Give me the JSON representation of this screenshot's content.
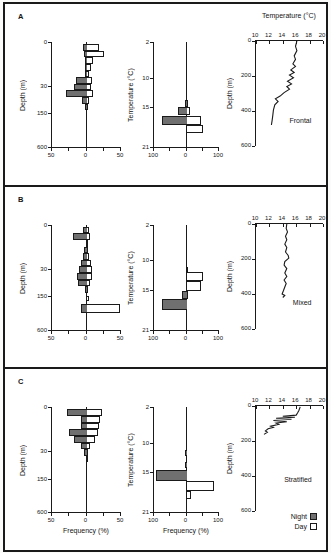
{
  "panels": [
    {
      "letter": "A"
    },
    {
      "letter": "B"
    },
    {
      "letter": "C"
    }
  ],
  "legend": {
    "night_label": "Night",
    "day_label": "Day"
  },
  "colors": {
    "night_fill": "#707070",
    "day_fill": "#ffffff",
    "line": "#1a1a1a",
    "frame": "#1a1a1a"
  },
  "chart_data": [
    {
      "type": "bar",
      "panel": "A",
      "orientation": "horizontal-diverging",
      "ylabel": "Depth (m)",
      "xmax": 50,
      "yticks": [
        [
          "0",
          0
        ],
        [
          "30",
          0.42
        ],
        [
          "150",
          0.68
        ],
        [
          "600",
          1
        ]
      ],
      "xticks": [
        [
          "50",
          0
        ],
        [
          "0",
          0.5
        ],
        [
          "50",
          1
        ]
      ],
      "series": [
        "Night",
        "Day"
      ],
      "bins": [
        {
          "pos": 0.02,
          "night": 5,
          "day": 18
        },
        {
          "pos": 0.083,
          "night": 3,
          "day": 25
        },
        {
          "pos": 0.146,
          "night": 2,
          "day": 10
        },
        {
          "pos": 0.209,
          "night": 2,
          "day": 7
        },
        {
          "pos": 0.272,
          "night": 2,
          "day": 4
        },
        {
          "pos": 0.335,
          "night": 15,
          "day": 8
        },
        {
          "pos": 0.398,
          "night": 18,
          "day": 6
        },
        {
          "pos": 0.461,
          "night": 30,
          "day": 10
        },
        {
          "pos": 0.524,
          "night": 6,
          "day": 4
        },
        {
          "pos": 0.587,
          "night": 2,
          "day": 1
        }
      ]
    },
    {
      "type": "bar",
      "panel": "A",
      "orientation": "horizontal-diverging",
      "ylabel": "Temperature (°C)",
      "xmax": 100,
      "yticks": [
        [
          "2",
          0
        ],
        [
          "10",
          0.34
        ],
        [
          "15",
          0.62
        ],
        [
          "21",
          1
        ]
      ],
      "xticks": [
        [
          "100",
          0
        ],
        [
          "0",
          0.5
        ],
        [
          "100",
          1
        ]
      ],
      "series": [
        "Night",
        "Day"
      ],
      "bins": [
        {
          "pos": 0.5,
          "night": 3,
          "day": 0,
          "h": 0.05
        },
        {
          "pos": 0.55,
          "night": 4,
          "day": 2,
          "h": 0.07
        },
        {
          "pos": 0.62,
          "night": 25,
          "day": 12,
          "h": 0.08
        },
        {
          "pos": 0.7,
          "night": 75,
          "day": 45,
          "h": 0.09
        },
        {
          "pos": 0.79,
          "night": 2,
          "day": 50,
          "h": 0.08
        }
      ]
    },
    {
      "type": "line",
      "panel": "A",
      "title": "Temperature (°C)",
      "label": "Frontal",
      "ylabel": "Depth (m)",
      "xrange": [
        10,
        20
      ],
      "yrange": [
        0,
        600
      ],
      "xticks": [
        [
          "10",
          0
        ],
        [
          "12",
          0.2
        ],
        [
          "14",
          0.4
        ],
        [
          "16",
          0.6
        ],
        [
          "18",
          0.8
        ],
        [
          "20",
          1
        ]
      ],
      "yticks": [
        [
          "0",
          0
        ],
        [
          "200",
          0.333
        ],
        [
          "400",
          0.667
        ],
        [
          "600",
          1
        ]
      ],
      "label_pos": [
        0.5,
        0.72
      ],
      "points": [
        [
          16.1,
          0
        ],
        [
          15.9,
          30
        ],
        [
          16.1,
          55
        ],
        [
          15.7,
          85
        ],
        [
          15.9,
          105
        ],
        [
          15.5,
          130
        ],
        [
          15.9,
          145
        ],
        [
          15.2,
          165
        ],
        [
          15.7,
          180
        ],
        [
          15.0,
          195
        ],
        [
          15.6,
          210
        ],
        [
          14.7,
          230
        ],
        [
          15.3,
          245
        ],
        [
          14.6,
          260
        ],
        [
          15.0,
          275
        ],
        [
          14.2,
          295
        ],
        [
          13.6,
          315
        ],
        [
          12.9,
          330
        ],
        [
          13.3,
          345
        ],
        [
          12.8,
          365
        ],
        [
          12.6,
          395
        ],
        [
          12.5,
          425
        ],
        [
          12.4,
          455
        ],
        [
          12.3,
          480
        ]
      ]
    },
    {
      "type": "bar",
      "panel": "B",
      "orientation": "horizontal-diverging",
      "ylabel": "Depth (m)",
      "xmax": 50,
      "yticks": [
        [
          "0",
          0
        ],
        [
          "30",
          0.42
        ],
        [
          "150",
          0.68
        ],
        [
          "600",
          1
        ]
      ],
      "xticks": [
        [
          "50",
          0
        ],
        [
          "0",
          0.5
        ],
        [
          "50",
          1
        ]
      ],
      "series": [
        "Night",
        "Day"
      ],
      "bins": [
        {
          "pos": 0.02,
          "night": 5,
          "day": 3
        },
        {
          "pos": 0.083,
          "night": 20,
          "day": 5
        },
        {
          "pos": 0.146,
          "night": 1,
          "day": 1
        },
        {
          "pos": 0.209,
          "night": 3,
          "day": 2
        },
        {
          "pos": 0.272,
          "night": 5,
          "day": 3
        },
        {
          "pos": 0.335,
          "night": 8,
          "day": 6
        },
        {
          "pos": 0.398,
          "night": 11,
          "day": 8
        },
        {
          "pos": 0.461,
          "night": 14,
          "day": 8
        },
        {
          "pos": 0.524,
          "night": 12,
          "day": 5
        },
        {
          "pos": 0.587,
          "night": 2,
          "day": 1
        },
        {
          "pos": 0.68,
          "night": 0,
          "day": 3,
          "h": 0.05
        },
        {
          "pos": 0.76,
          "night": 8,
          "day": 48,
          "h": 0.08
        }
      ]
    },
    {
      "type": "bar",
      "panel": "B",
      "orientation": "horizontal-diverging",
      "ylabel": "Temperature (°C)",
      "xmax": 100,
      "yticks": [
        [
          "2",
          0
        ],
        [
          "10",
          0.34
        ],
        [
          "15",
          0.62
        ],
        [
          "21",
          1
        ]
      ],
      "xticks": [
        [
          "100",
          0
        ],
        [
          "0",
          0.5
        ],
        [
          "100",
          1
        ]
      ],
      "series": [
        "Night",
        "Day"
      ],
      "bins": [
        {
          "pos": 0.4,
          "night": 0,
          "day": 3,
          "h": 0.05
        },
        {
          "pos": 0.45,
          "night": 0,
          "day": 50,
          "h": 0.09
        },
        {
          "pos": 0.54,
          "night": 0,
          "day": 45,
          "h": 0.09
        },
        {
          "pos": 0.63,
          "night": 15,
          "day": 2,
          "h": 0.08
        },
        {
          "pos": 0.71,
          "night": 75,
          "day": 0,
          "h": 0.1
        }
      ]
    },
    {
      "type": "line",
      "panel": "B",
      "label": "Mixed",
      "ylabel": "Depth (m)",
      "xrange": [
        10,
        20
      ],
      "yrange": [
        0,
        600
      ],
      "xticks": [
        [
          "10",
          0
        ],
        [
          "12",
          0.2
        ],
        [
          "14",
          0.4
        ],
        [
          "16",
          0.6
        ],
        [
          "18",
          0.8
        ],
        [
          "20",
          1
        ]
      ],
      "yticks": [
        [
          "0",
          0
        ],
        [
          "200",
          0.333
        ],
        [
          "400",
          0.667
        ],
        [
          "600",
          1
        ]
      ],
      "label_pos": [
        0.55,
        0.72
      ],
      "points": [
        [
          14.6,
          0
        ],
        [
          14.5,
          25
        ],
        [
          14.7,
          45
        ],
        [
          14.4,
          70
        ],
        [
          14.6,
          90
        ],
        [
          14.3,
          115
        ],
        [
          14.6,
          135
        ],
        [
          14.4,
          160
        ],
        [
          14.8,
          180
        ],
        [
          14.9,
          195
        ],
        [
          14.3,
          215
        ],
        [
          14.2,
          235
        ],
        [
          14.6,
          255
        ],
        [
          14.3,
          280
        ],
        [
          14.6,
          300
        ],
        [
          14.2,
          320
        ],
        [
          14.5,
          340
        ],
        [
          14.3,
          360
        ],
        [
          14.1,
          380
        ],
        [
          13.9,
          400
        ],
        [
          14.3,
          408
        ],
        [
          14.0,
          420
        ]
      ]
    },
    {
      "type": "bar",
      "panel": "C",
      "orientation": "horizontal-diverging",
      "ylabel": "Depth (m)",
      "xlabel": "Frequency (%)",
      "xmax": 50,
      "yticks": [
        [
          "0",
          0
        ],
        [
          "30",
          0.42
        ],
        [
          "150",
          0.68
        ],
        [
          "600",
          1
        ]
      ],
      "xticks": [
        [
          "50",
          0
        ],
        [
          "0",
          0.5
        ],
        [
          "50",
          1
        ]
      ],
      "series": [
        "Night",
        "Day"
      ],
      "bins": [
        {
          "pos": 0.02,
          "night": 28,
          "day": 22
        },
        {
          "pos": 0.083,
          "night": 8,
          "day": 20
        },
        {
          "pos": 0.146,
          "night": 8,
          "day": 18
        },
        {
          "pos": 0.209,
          "night": 25,
          "day": 16
        },
        {
          "pos": 0.272,
          "night": 18,
          "day": 12
        },
        {
          "pos": 0.335,
          "night": 8,
          "day": 5
        },
        {
          "pos": 0.398,
          "night": 3,
          "day": 2
        },
        {
          "pos": 0.461,
          "night": 1,
          "day": 1
        }
      ]
    },
    {
      "type": "bar",
      "panel": "C",
      "orientation": "horizontal-diverging",
      "ylabel": "Temperature (°C)",
      "xlabel": "Frequency (%)",
      "xmax": 100,
      "yticks": [
        [
          "2",
          0
        ],
        [
          "10",
          0.34
        ],
        [
          "15",
          0.62
        ],
        [
          "21",
          1
        ]
      ],
      "xticks": [
        [
          "100",
          0
        ],
        [
          "0",
          0.5
        ],
        [
          "100",
          1
        ]
      ],
      "series": [
        "Night",
        "Day"
      ],
      "bins": [
        {
          "pos": 0.41,
          "night": 4,
          "day": 0,
          "h": 0.05
        },
        {
          "pos": 0.52,
          "night": 6,
          "day": 0,
          "h": 0.06
        },
        {
          "pos": 0.6,
          "night": 95,
          "day": 0,
          "h": 0.1
        },
        {
          "pos": 0.7,
          "night": 0,
          "day": 85,
          "h": 0.1
        },
        {
          "pos": 0.8,
          "night": 0,
          "day": 15,
          "h": 0.07
        }
      ]
    },
    {
      "type": "line",
      "panel": "C",
      "label": "Stratified",
      "ylabel": "Depth (m)",
      "xrange": [
        10,
        20
      ],
      "yrange": [
        0,
        600
      ],
      "xticks": [
        [
          "10",
          0
        ],
        [
          "12",
          0.2
        ],
        [
          "14",
          0.4
        ],
        [
          "16",
          0.6
        ],
        [
          "18",
          0.8
        ],
        [
          "20",
          1
        ]
      ],
      "yticks": [
        [
          "0",
          0
        ],
        [
          "200",
          0.333
        ],
        [
          "400",
          0.667
        ],
        [
          "600",
          1
        ]
      ],
      "label_pos": [
        0.42,
        0.66
      ],
      "points": [
        [
          16.6,
          5
        ],
        [
          16.4,
          25
        ],
        [
          16.2,
          40
        ],
        [
          16.0,
          52
        ],
        [
          14.0,
          58
        ],
        [
          15.8,
          64
        ],
        [
          13.0,
          70
        ],
        [
          15.3,
          76
        ],
        [
          12.6,
          83
        ],
        [
          14.6,
          90
        ],
        [
          13.0,
          97
        ],
        [
          13.4,
          105
        ],
        [
          12.2,
          115
        ],
        [
          12.6,
          122
        ],
        [
          11.8,
          130
        ],
        [
          11.4,
          142
        ],
        [
          11.7,
          150
        ],
        [
          11.2,
          162
        ]
      ]
    }
  ]
}
